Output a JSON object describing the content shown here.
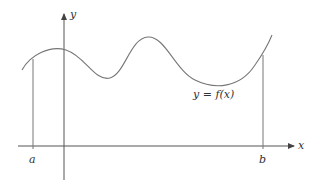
{
  "diagram": {
    "y_axis_label": "y",
    "x_axis_label": "x",
    "curve_label": "y = f(x)",
    "left_bound_label": "a",
    "right_bound_label": "b",
    "colors": {
      "curve": "#777777",
      "axes": "#555555",
      "text": "#333333"
    }
  }
}
